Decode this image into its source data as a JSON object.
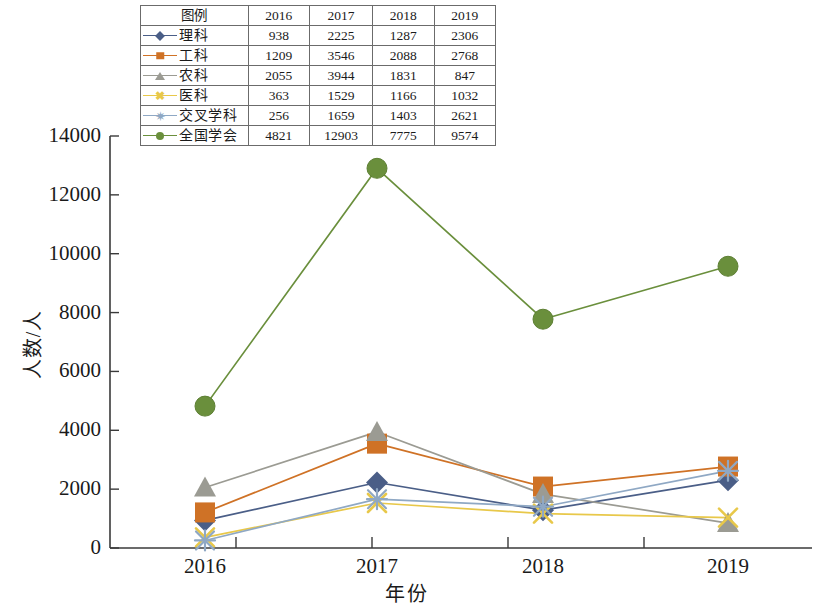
{
  "chart_data": {
    "type": "line",
    "title": "",
    "xlabel": "年份",
    "ylabel": "人数/人",
    "categories": [
      "2016",
      "2017",
      "2018",
      "2019"
    ],
    "ylim": [
      0,
      14000
    ],
    "yticks": [
      0,
      2000,
      4000,
      6000,
      8000,
      10000,
      12000,
      14000
    ],
    "grid": false,
    "legend_position": "table-top",
    "series": [
      {
        "name": "理科",
        "values": [
          938,
          2225,
          1287,
          2306
        ],
        "color": "#4a5e87",
        "marker": "diamond"
      },
      {
        "name": "工科",
        "values": [
          1209,
          3546,
          2088,
          2768
        ],
        "color": "#cf7226",
        "marker": "square"
      },
      {
        "name": "农科",
        "values": [
          2055,
          3944,
          1831,
          847
        ],
        "color": "#9b9b93",
        "marker": "triangle"
      },
      {
        "name": "医科",
        "values": [
          363,
          1529,
          1166,
          1032
        ],
        "color": "#e8c84a",
        "marker": "x"
      },
      {
        "name": "交叉学科",
        "values": [
          256,
          1659,
          1403,
          2621
        ],
        "color": "#8fa8c4",
        "marker": "star"
      },
      {
        "name": "全国学会",
        "values": [
          4821,
          12903,
          7775,
          9574
        ],
        "color": "#6a8f3c",
        "marker": "circle"
      }
    ]
  },
  "legend_table": {
    "header": [
      "图例",
      "2016",
      "2017",
      "2018",
      "2019"
    ],
    "rows": [
      {
        "label": "理科",
        "marker": "diamond",
        "color": "#4a5e87",
        "values": [
          "938",
          "2225",
          "1287",
          "2306"
        ]
      },
      {
        "label": "工科",
        "marker": "square",
        "color": "#cf7226",
        "values": [
          "1209",
          "3546",
          "2088",
          "2768"
        ]
      },
      {
        "label": "农科",
        "marker": "triangle",
        "color": "#9b9b93",
        "values": [
          "2055",
          "3944",
          "1831",
          "847"
        ]
      },
      {
        "label": "医科",
        "marker": "x",
        "color": "#e8c84a",
        "values": [
          "363",
          "1529",
          "1166",
          "1032"
        ]
      },
      {
        "label": "交叉学科",
        "marker": "star",
        "color": "#8fa8c4",
        "values": [
          "256",
          "1659",
          "1403",
          "2621"
        ]
      },
      {
        "label": "全国学会",
        "marker": "circle",
        "color": "#6a8f3c",
        "values": [
          "4821",
          "12903",
          "7775",
          "9574"
        ]
      }
    ]
  },
  "axes": {
    "y_axis_title": "人数/人",
    "x_axis_title": "年份",
    "y_tick_labels": [
      "14000",
      "12000",
      "10000",
      "8000",
      "6000",
      "4000",
      "2000",
      "0"
    ],
    "x_tick_labels": [
      "2016",
      "2017",
      "2018",
      "2019"
    ],
    "axis_color": "#3a3a3a"
  }
}
